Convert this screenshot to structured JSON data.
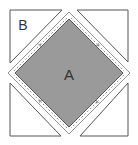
{
  "diagram": {
    "type": "quilt-block-square-in-square",
    "labels": {
      "center": "A",
      "corner": "B"
    },
    "colors": {
      "center_fill": "#9a9a9a",
      "corner_fill": "#ffffff",
      "outline": "#555555",
      "seam_line": "#777777"
    },
    "pieces": [
      {
        "id": "A",
        "shape": "square-on-point",
        "position": "center"
      },
      {
        "id": "B",
        "shape": "triangle",
        "position": "top-left"
      },
      {
        "id": "B",
        "shape": "triangle",
        "position": "top-right"
      },
      {
        "id": "B",
        "shape": "triangle",
        "position": "bottom-left"
      },
      {
        "id": "B",
        "shape": "triangle",
        "position": "bottom-right"
      }
    ],
    "seam_arrows": "dashed stitching lines with direction arrows around center square"
  }
}
